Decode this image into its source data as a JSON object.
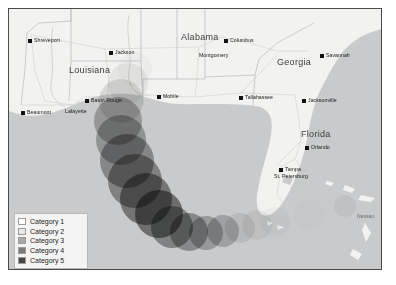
{
  "map": {
    "title": "Hurricane track intensity map",
    "colors": {
      "background": "#ffffff",
      "ocean": "#c9cacb",
      "land": "#f2f2f1",
      "border_line": "#4a4a4a",
      "state_line": "#b4b4b4",
      "road_line": "#c8c8c4",
      "city_dot": "#111111",
      "legend_bg": "#f4f4f4",
      "legend_border": "#b9b9b9"
    },
    "states": [
      {
        "label": "Louisiana",
        "x": 60,
        "y": 57
      },
      {
        "label": "Alabama",
        "x": 172,
        "y": 24
      },
      {
        "label": "Georgia",
        "x": 268,
        "y": 49
      },
      {
        "label": "Florida",
        "x": 292,
        "y": 121
      }
    ],
    "cities": [
      {
        "label": "Shreveport",
        "x": 19,
        "y": 29,
        "place": "right"
      },
      {
        "label": "Jackson",
        "x": 100,
        "y": 41,
        "place": "right"
      },
      {
        "label": "Columbus",
        "x": 215,
        "y": 29,
        "place": "right"
      },
      {
        "label": "Montgomery",
        "x": 190,
        "y": 44,
        "place": "below"
      },
      {
        "label": "Savannah",
        "x": 311,
        "y": 44,
        "place": "right"
      },
      {
        "label": "Baton Rouge",
        "x": 76,
        "y": 89,
        "place": "right"
      },
      {
        "label": "Beaumont",
        "x": 12,
        "y": 101,
        "place": "right"
      },
      {
        "label": "Lafayette",
        "x": 56,
        "y": 100,
        "place": "below"
      },
      {
        "label": "Mobile",
        "x": 148,
        "y": 85,
        "place": "right"
      },
      {
        "label": "Tallahassee",
        "x": 230,
        "y": 86,
        "place": "right"
      },
      {
        "label": "Jacksonville",
        "x": 293,
        "y": 89,
        "place": "right"
      },
      {
        "label": "Orlando",
        "x": 296,
        "y": 136,
        "place": "right"
      },
      {
        "label": "Tampa",
        "x": 270,
        "y": 158,
        "place": "right"
      },
      {
        "label": "St. Petersburg",
        "x": 265,
        "y": 165,
        "place": "below"
      }
    ],
    "water_labels": [
      {
        "label": "Nassau",
        "x": 348,
        "y": 204
      }
    ]
  },
  "legend": {
    "title": "Saffir-Simpson category",
    "items": [
      {
        "label": "Category 1",
        "color": "#ffffff"
      },
      {
        "label": "Category 2",
        "color": "#e8e8e8"
      },
      {
        "label": "Category 3",
        "color": "#a8a8a8"
      },
      {
        "label": "Category 4",
        "color": "#7b7b7b"
      },
      {
        "label": "Category 5",
        "color": "#474747"
      }
    ]
  },
  "chart_data": {
    "type": "scatter",
    "xlabel": "",
    "ylabel": "",
    "legend_position": "bottom-left",
    "grid": false,
    "encoding": {
      "position": "storm center location on map",
      "size": "wind field extent",
      "color": "Saffir-Simpson category (lighter = weaker, darker = stronger)"
    },
    "categories": [
      "Category 1",
      "Category 2",
      "Category 3",
      "Category 4",
      "Category 5"
    ],
    "category_colors": [
      "#ffffff",
      "#e8e8e8",
      "#a8a8a8",
      "#7b7b7b",
      "#474747"
    ],
    "series": [
      {
        "name": "Storm track",
        "points": [
          {
            "x": 352,
            "y": 196,
            "r": 9,
            "category": 1,
            "color": "#ffffff"
          },
          {
            "x": 336,
            "y": 197,
            "r": 11,
            "category": 1,
            "color": "#f0f0f0"
          },
          {
            "x": 316,
            "y": 199,
            "r": 14,
            "category": 1,
            "color": "#ffffff"
          },
          {
            "x": 300,
            "y": 205,
            "r": 15,
            "category": 1,
            "color": "#fafafa"
          },
          {
            "x": 283,
            "y": 209,
            "r": 15,
            "category": 1,
            "color": "#ffffff"
          },
          {
            "x": 266,
            "y": 213,
            "r": 15,
            "category": 1,
            "color": "#f6f6f6"
          },
          {
            "x": 248,
            "y": 216,
            "r": 15,
            "category": 2,
            "color": "#ededed"
          },
          {
            "x": 231,
            "y": 219,
            "r": 15,
            "category": 2,
            "color": "#e4e4e4"
          },
          {
            "x": 214,
            "y": 222,
            "r": 16,
            "category": 3,
            "color": "#b5b5b5"
          },
          {
            "x": 197,
            "y": 224,
            "r": 17,
            "category": 3,
            "color": "#a9a9a9"
          },
          {
            "x": 180,
            "y": 223,
            "r": 19,
            "category": 4,
            "color": "#8d8d8d"
          },
          {
            "x": 163,
            "y": 218,
            "r": 21,
            "category": 4,
            "color": "#808080"
          },
          {
            "x": 150,
            "y": 205,
            "r": 24,
            "category": 5,
            "color": "#5e5e5e"
          },
          {
            "x": 137,
            "y": 190,
            "r": 26,
            "category": 5,
            "color": "#6a6a6a"
          },
          {
            "x": 126,
            "y": 172,
            "r": 27,
            "category": 4,
            "color": "#7e7e7e"
          },
          {
            "x": 118,
            "y": 152,
            "r": 27,
            "category": 4,
            "color": "#888888"
          },
          {
            "x": 112,
            "y": 131,
            "r": 25,
            "category": 3,
            "color": "#9c9c9c"
          },
          {
            "x": 109,
            "y": 112,
            "r": 24,
            "category": 3,
            "color": "#a5a5a5"
          },
          {
            "x": 112,
            "y": 92,
            "r": 22,
            "category": 2,
            "color": "#d8d8d8"
          },
          {
            "x": 119,
            "y": 74,
            "r": 20,
            "category": 1,
            "color": "#ededed"
          },
          {
            "x": 126,
            "y": 60,
            "r": 17,
            "category": 1,
            "color": "#f7f7f7"
          }
        ]
      }
    ]
  }
}
